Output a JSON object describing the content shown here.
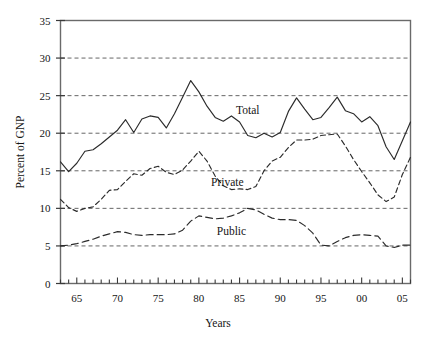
{
  "chart_data": {
    "type": "line",
    "title": "",
    "xlabel": "Years",
    "ylabel": "Percent of GNP",
    "xlim": [
      63,
      106
    ],
    "ylim": [
      0,
      35
    ],
    "grid": true,
    "grid_axis": "y",
    "grid_style": "dashed",
    "legend": "inline-annotations",
    "y_ticks": [
      0,
      5,
      10,
      15,
      20,
      25,
      30,
      35
    ],
    "y_tick_labels": [
      "0",
      "5",
      "10",
      "15",
      "20",
      "25",
      "30",
      "35"
    ],
    "x_major_ticks": [
      65,
      70,
      75,
      80,
      85,
      90,
      95,
      100,
      105
    ],
    "x_tick_labels": [
      "65",
      "70",
      "75",
      "80",
      "85",
      "90",
      "95",
      "00",
      "05"
    ],
    "x_minor_tick_interval": 1,
    "x": [
      63,
      64,
      65,
      66,
      67,
      68,
      69,
      70,
      71,
      72,
      73,
      74,
      75,
      76,
      77,
      78,
      79,
      80,
      81,
      82,
      83,
      84,
      85,
      86,
      87,
      88,
      89,
      90,
      91,
      92,
      93,
      94,
      95,
      96,
      97,
      98,
      99,
      100,
      101,
      102,
      103,
      104,
      105,
      106
    ],
    "series": [
      {
        "name": "Total",
        "line_style": "solid",
        "color": "#2b2b2b",
        "label_x": 86,
        "label_y": 22.6,
        "values": [
          16.2,
          14.9,
          16.0,
          17.6,
          17.8,
          18.6,
          19.5,
          20.4,
          21.8,
          20.1,
          21.9,
          22.3,
          22.1,
          20.7,
          22.6,
          24.8,
          27.0,
          25.5,
          23.6,
          22.1,
          21.6,
          22.3,
          21.5,
          19.7,
          19.4,
          20.0,
          19.5,
          20.1,
          22.9,
          24.7,
          23.2,
          21.8,
          22.1,
          23.4,
          24.8,
          23.0,
          22.6,
          21.5,
          22.2,
          21.0,
          18.2,
          16.5,
          19.0,
          21.5
        ]
      },
      {
        "name": "Private",
        "line_style": "dashed",
        "color": "#2b2b2b",
        "label_x": 83.5,
        "label_y": 13.0,
        "values": [
          11.2,
          10.1,
          9.6,
          10.0,
          10.2,
          11.2,
          12.4,
          12.5,
          13.6,
          14.6,
          14.4,
          15.3,
          15.6,
          14.8,
          14.5,
          15.1,
          16.3,
          17.6,
          16.3,
          14.3,
          13.0,
          12.5,
          12.6,
          12.5,
          12.9,
          15.0,
          16.3,
          16.8,
          18.1,
          19.1,
          19.1,
          19.2,
          19.7,
          19.8,
          19.9,
          18.3,
          16.5,
          14.9,
          13.4,
          11.8,
          10.9,
          11.5,
          14.5,
          16.8
        ]
      },
      {
        "name": "Public",
        "line_style": "dashed-long",
        "color": "#2b2b2b",
        "label_x": 84,
        "label_y": 6.5,
        "values": [
          5.0,
          5.1,
          5.3,
          5.6,
          5.9,
          6.3,
          6.6,
          6.9,
          6.8,
          6.5,
          6.4,
          6.5,
          6.5,
          6.5,
          6.6,
          7.1,
          8.3,
          9.0,
          8.8,
          8.6,
          8.7,
          9.0,
          9.4,
          10.0,
          9.8,
          9.2,
          8.7,
          8.5,
          8.5,
          8.4,
          7.7,
          6.7,
          5.1,
          5.0,
          5.6,
          6.1,
          6.4,
          6.5,
          6.4,
          6.3,
          5.0,
          4.8,
          5.1,
          5.1
        ]
      }
    ]
  }
}
